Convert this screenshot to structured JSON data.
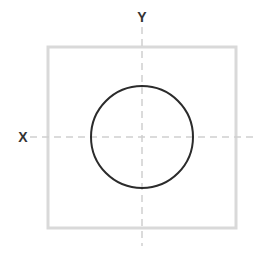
{
  "diagram": {
    "labels": {
      "x_axis": "X",
      "y_axis": "Y"
    },
    "colors": {
      "square_stroke": "#d9d9d9",
      "circle_stroke": "#2b2b2b",
      "axis_stroke": "#cfcfcf",
      "label_color": "#333333",
      "background": "#ffffff"
    },
    "shapes": {
      "square": {
        "x": 48,
        "y": 47,
        "width": 188,
        "height": 181
      },
      "circle": {
        "cx": 142,
        "cy": 137,
        "r": 51
      },
      "x_axis_line": {
        "x1": 30,
        "y1": 137,
        "x2": 253,
        "y2": 137
      },
      "y_axis_line": {
        "x1": 142,
        "y1": 27,
        "x2": 142,
        "y2": 246
      }
    }
  }
}
